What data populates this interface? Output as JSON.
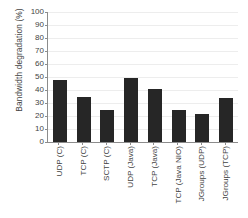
{
  "chart_data": {
    "type": "bar",
    "title": "",
    "xlabel": "",
    "ylabel": "Bandwidth degradation (%)",
    "ylim": [
      0,
      100
    ],
    "grid": true,
    "legend": null,
    "categories": [
      "UDP (C)",
      "TCP (C)",
      "SCTP (C)",
      "UDP (Java)",
      "TCP (Java)",
      "TCP (Java NIO)",
      "JGroups (UDP)",
      "JGroups (TCP)"
    ],
    "values": [
      48,
      34.5,
      25,
      49.5,
      41,
      24.5,
      21.5,
      34
    ],
    "yticks": [
      0,
      10,
      20,
      30,
      40,
      50,
      60,
      70,
      80,
      90,
      100
    ],
    "ytick_labels": [
      "0",
      "10",
      "20",
      "30",
      "40",
      "50",
      "60",
      "70",
      "80",
      "90",
      "100"
    ],
    "colors": {
      "bar": "#262626",
      "gridline": "#ededed",
      "axis": "#8c8c8c",
      "text": "#434343",
      "background": "#ffffff"
    }
  }
}
